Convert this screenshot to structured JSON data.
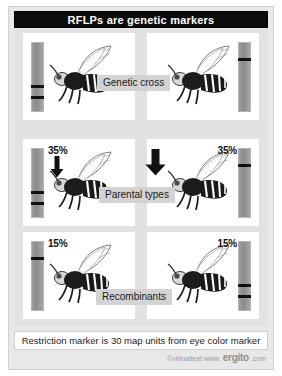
{
  "figure": {
    "title": "RFLPs are genetic markers",
    "caption": "Restriction marker is 30 map units from eye color marker",
    "credit": {
      "prefix": "©virtualtext",
      "www": "www.",
      "brand": "ergito",
      "suffix": ".com"
    },
    "colors": {
      "title_bar_bg": "#0b0b0b",
      "title_text": "#ffffff",
      "panel_bg": "#ffffff",
      "body_bg": "#e2e2e2",
      "gel_lane": "#8c8c8c",
      "band": "#101010",
      "label_bg": "#d3d3d3",
      "arrow": "#111111"
    }
  },
  "rows": [
    {
      "name": "genetic-cross",
      "label": "Genetic cross",
      "left": {
        "percent": "",
        "gel_side": "left",
        "bands": [
          62,
          78
        ],
        "has_arrow": false
      },
      "right": {
        "percent": "",
        "gel_side": "right",
        "bands": [
          22
        ],
        "has_arrow": false
      }
    },
    {
      "name": "parental-types",
      "label": "Parental types",
      "left": {
        "percent": "35%",
        "gel_side": "left",
        "bands": [
          62,
          78
        ],
        "has_arrow": true
      },
      "right": {
        "percent": "35%",
        "gel_side": "right",
        "bands": [
          22
        ],
        "has_arrow": false
      }
    },
    {
      "name": "recombinants",
      "label": "Recombinants",
      "left": {
        "percent": "15%",
        "gel_side": "left",
        "bands": [
          22
        ],
        "has_arrow": false
      },
      "right": {
        "percent": "15%",
        "gel_side": "right",
        "bands": [
          62,
          78
        ],
        "has_arrow": false
      }
    }
  ],
  "icons": {
    "fly": "fruit-fly-icon",
    "down_arrow": "down-arrow-icon",
    "mini_down_arrow": "small-down-arrow-icon"
  }
}
